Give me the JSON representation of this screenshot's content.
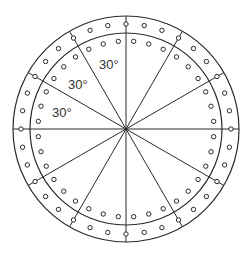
{
  "diagram": {
    "type": "circular-plate-hole-pattern",
    "center": [
      126,
      129
    ],
    "outer_radius": 113,
    "middle_radius": 96,
    "stroke_color": "#2a2a2a",
    "spoke_angles_deg": [
      0,
      30,
      60,
      90,
      120,
      150,
      180,
      210,
      240,
      270,
      300,
      330
    ],
    "outer_hole_row": {
      "radius": 105,
      "step_deg": 10,
      "hole_r": 2.2
    },
    "inner_hole_row": {
      "radius": 88,
      "step_deg": 10,
      "hole_r": 2.2
    },
    "labels": [
      {
        "text": "30°",
        "x": 99,
        "y": 58
      },
      {
        "text": "30°",
        "x": 68,
        "y": 78
      },
      {
        "text": "30°",
        "x": 52,
        "y": 106
      }
    ]
  }
}
